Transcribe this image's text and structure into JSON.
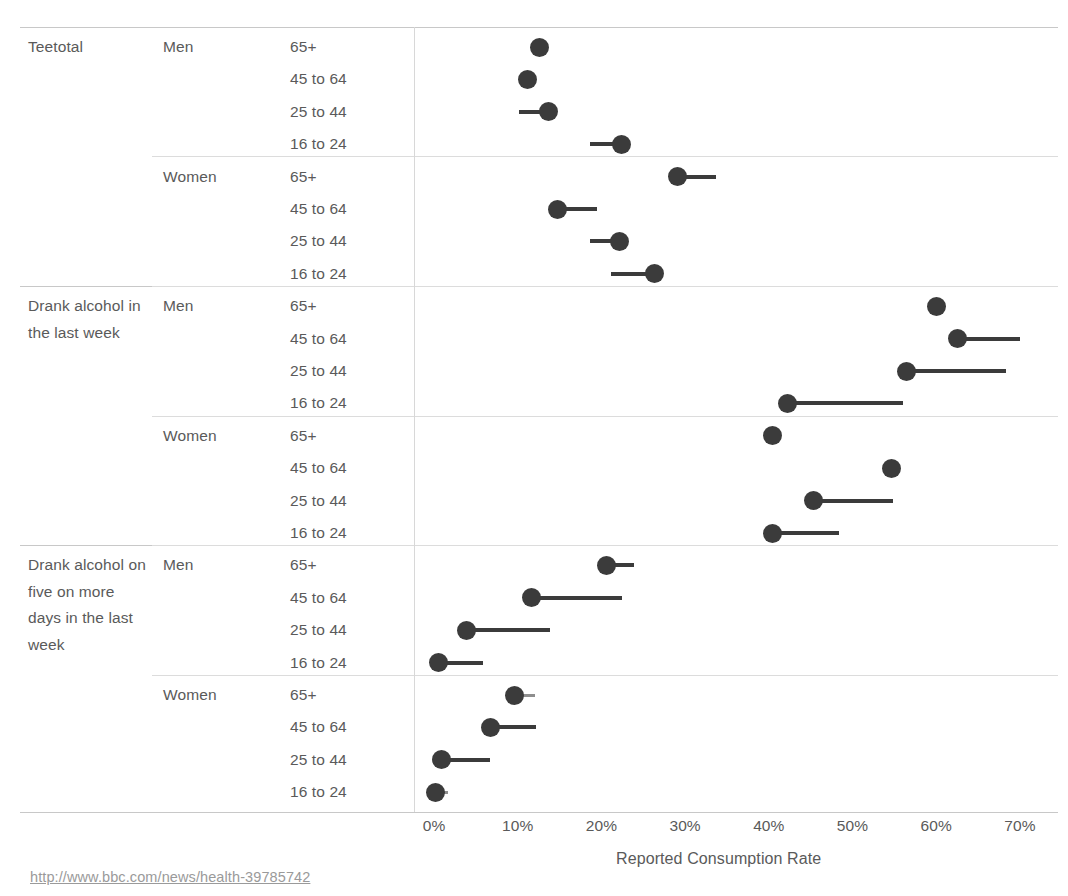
{
  "axis": {
    "title": "Reported Consumption Rate",
    "ticks": [
      "0%",
      "10%",
      "20%",
      "30%",
      "40%",
      "50%",
      "60%",
      "70%"
    ],
    "tick_values": [
      0,
      10,
      20,
      30,
      40,
      50,
      60,
      70
    ]
  },
  "source": {
    "url": "http://www.bbc.com/news/health-39785742"
  },
  "colors": {
    "dot": "#3b3b3b",
    "line_dark": "#3b3b3b",
    "line_light": "#8e8e8e",
    "rule": "#d6d6d6",
    "text": "#5a5a5a",
    "background": "#ffffff"
  },
  "groups": [
    {
      "category": "Teetotal",
      "genders": [
        {
          "gender": "Men",
          "rows": [
            {
              "age": "65+",
              "value": 12.6,
              "reference": 12.6
            },
            {
              "age": "45 to 64",
              "value": 11.2,
              "reference": 10.2
            },
            {
              "age": "25 to 44",
              "value": 13.7,
              "reference": 10.2
            },
            {
              "age": "16 to 24",
              "value": 22.4,
              "reference": 18.6
            }
          ]
        },
        {
          "gender": "Women",
          "rows": [
            {
              "age": "65+",
              "value": 29.1,
              "reference": 33.7
            },
            {
              "age": "45 to 64",
              "value": 14.7,
              "reference": 19.5
            },
            {
              "age": "25 to 44",
              "value": 22.2,
              "reference": 18.6
            },
            {
              "age": "16 to 24",
              "value": 26.3,
              "reference": 21.2
            }
          ]
        }
      ]
    },
    {
      "category": "Drank alcohol in the last week",
      "genders": [
        {
          "gender": "Men",
          "rows": [
            {
              "age": "65+",
              "value": 60.0,
              "reference": 60.0
            },
            {
              "age": "45 to 64",
              "value": 62.6,
              "reference": 70.0
            },
            {
              "age": "25 to 44",
              "value": 56.4,
              "reference": 68.3
            },
            {
              "age": "16 to 24",
              "value": 42.2,
              "reference": 56.0
            }
          ]
        },
        {
          "gender": "Women",
          "rows": [
            {
              "age": "65+",
              "value": 40.5,
              "reference": 40.5
            },
            {
              "age": "45 to 64",
              "value": 54.7,
              "reference": 54.7
            },
            {
              "age": "25 to 44",
              "value": 45.3,
              "reference": 54.8
            },
            {
              "age": "16 to 24",
              "value": 40.5,
              "reference": 48.4
            }
          ]
        }
      ]
    },
    {
      "category": "Drank alcohol on five on more days in the last week",
      "genders": [
        {
          "gender": "Men",
          "rows": [
            {
              "age": "65+",
              "value": 20.6,
              "reference": 23.9
            },
            {
              "age": "45 to 64",
              "value": 11.6,
              "reference": 22.5
            },
            {
              "age": "25 to 44",
              "value": 3.9,
              "reference": 13.8
            },
            {
              "age": "16 to 24",
              "value": 0.5,
              "reference": 5.8
            }
          ]
        },
        {
          "gender": "Women",
          "rows": [
            {
              "age": "65+",
              "value": 9.6,
              "reference": 12.1
            },
            {
              "age": "45 to 64",
              "value": 6.7,
              "reference": 12.2
            },
            {
              "age": "25 to 44",
              "value": 0.9,
              "reference": 6.7
            },
            {
              "age": "16 to 24",
              "value": 0.2,
              "reference": 1.7
            }
          ]
        }
      ]
    }
  ],
  "chart_data": {
    "type": "scatter",
    "title": "",
    "xlabel": "Reported Consumption Rate",
    "ylabel": "",
    "xlim": [
      -1.5,
      76
    ],
    "grid": false,
    "legend": null,
    "x_ticks": [
      0,
      10,
      20,
      30,
      40,
      50,
      60,
      70
    ],
    "x_tick_labels": [
      "0%",
      "10%",
      "20%",
      "30%",
      "40%",
      "50%",
      "60%",
      "70%"
    ],
    "note": "Dot = value; line connects the dot to a reference marker (lollipop/dumbbell segment).",
    "series": [
      {
        "name": "Teetotal / Men",
        "points": [
          {
            "category": "65+",
            "value": 12.6,
            "reference": 12.6
          },
          {
            "category": "45 to 64",
            "value": 11.2,
            "reference": 10.2
          },
          {
            "category": "25 to 44",
            "value": 13.7,
            "reference": 10.2
          },
          {
            "category": "16 to 24",
            "value": 22.4,
            "reference": 18.6
          }
        ]
      },
      {
        "name": "Teetotal / Women",
        "points": [
          {
            "category": "65+",
            "value": 29.1,
            "reference": 33.7
          },
          {
            "category": "45 to 64",
            "value": 14.7,
            "reference": 19.5
          },
          {
            "category": "25 to 44",
            "value": 22.2,
            "reference": 18.6
          },
          {
            "category": "16 to 24",
            "value": 26.3,
            "reference": 21.2
          }
        ]
      },
      {
        "name": "Drank alcohol in the last week / Men",
        "points": [
          {
            "category": "65+",
            "value": 60.0,
            "reference": 60.0
          },
          {
            "category": "45 to 64",
            "value": 62.6,
            "reference": 70.0
          },
          {
            "category": "25 to 44",
            "value": 56.4,
            "reference": 68.3
          },
          {
            "category": "16 to 24",
            "value": 42.2,
            "reference": 56.0
          }
        ]
      },
      {
        "name": "Drank alcohol in the last week / Women",
        "points": [
          {
            "category": "65+",
            "value": 40.5,
            "reference": 40.5
          },
          {
            "category": "45 to 64",
            "value": 54.7,
            "reference": 54.7
          },
          {
            "category": "25 to 44",
            "value": 45.3,
            "reference": 54.8
          },
          {
            "category": "16 to 24",
            "value": 40.5,
            "reference": 48.4
          }
        ]
      },
      {
        "name": "Drank alcohol on five on more days in the last week / Men",
        "points": [
          {
            "category": "65+",
            "value": 20.6,
            "reference": 23.9
          },
          {
            "category": "45 to 64",
            "value": 11.6,
            "reference": 22.5
          },
          {
            "category": "25 to 44",
            "value": 3.9,
            "reference": 13.8
          },
          {
            "category": "16 to 24",
            "value": 0.5,
            "reference": 5.8
          }
        ]
      },
      {
        "name": "Drank alcohol on five on more days in the last week / Women",
        "points": [
          {
            "category": "65+",
            "value": 9.6,
            "reference": 12.1
          },
          {
            "category": "45 to 64",
            "value": 6.7,
            "reference": 12.2
          },
          {
            "category": "25 to 44",
            "value": 0.9,
            "reference": 6.7
          },
          {
            "category": "16 to 24",
            "value": 0.2,
            "reference": 1.7
          }
        ]
      }
    ]
  }
}
